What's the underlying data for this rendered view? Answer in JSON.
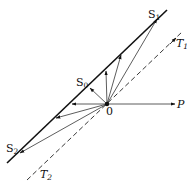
{
  "diagram": {
    "type": "vector diagram",
    "origin": {
      "label": "0",
      "x": 107,
      "y": 104
    },
    "lines": {
      "s_line": {
        "style": "solid",
        "from": [
          7,
          163
        ],
        "to": [
          167,
          10
        ]
      },
      "t_line": {
        "style": "dashed",
        "from": [
          27,
          180
        ],
        "to": [
          182,
          32
        ]
      }
    },
    "vectors": [
      {
        "name": "S1",
        "to": [
          157,
          19
        ],
        "on": "S line"
      },
      {
        "name": "v_upper",
        "to": [
          121,
          55
        ],
        "on": "S line"
      },
      {
        "name": "v_vertical",
        "to": [
          106,
          71
        ],
        "on": "S line"
      },
      {
        "name": "S0",
        "to": [
          90,
          88
        ],
        "on": "S line"
      },
      {
        "name": "v_left",
        "to": [
          72,
          104
        ],
        "on": "S line"
      },
      {
        "name": "v_lower",
        "to": [
          56,
          118
        ],
        "on": "S line"
      },
      {
        "name": "S2",
        "to": [
          20,
          153
        ],
        "on": "S line"
      },
      {
        "name": "T1",
        "to": [
          176,
          38
        ],
        "on": "T line (dashed)"
      },
      {
        "name": "P",
        "to": [
          175,
          104
        ],
        "on": "horizontal"
      }
    ],
    "labels": {
      "s1": {
        "main": "S",
        "sub": "1"
      },
      "s0": {
        "main": "S",
        "sub": "0"
      },
      "s2": {
        "main": "S",
        "sub": "2"
      },
      "t1": {
        "main": "T",
        "sub": "1"
      },
      "t2": {
        "main": "T",
        "sub": "2"
      },
      "p": "P",
      "origin": "0"
    },
    "colors": {
      "ink": "#111111",
      "thin": "#444444",
      "background": "#ffffff"
    }
  }
}
